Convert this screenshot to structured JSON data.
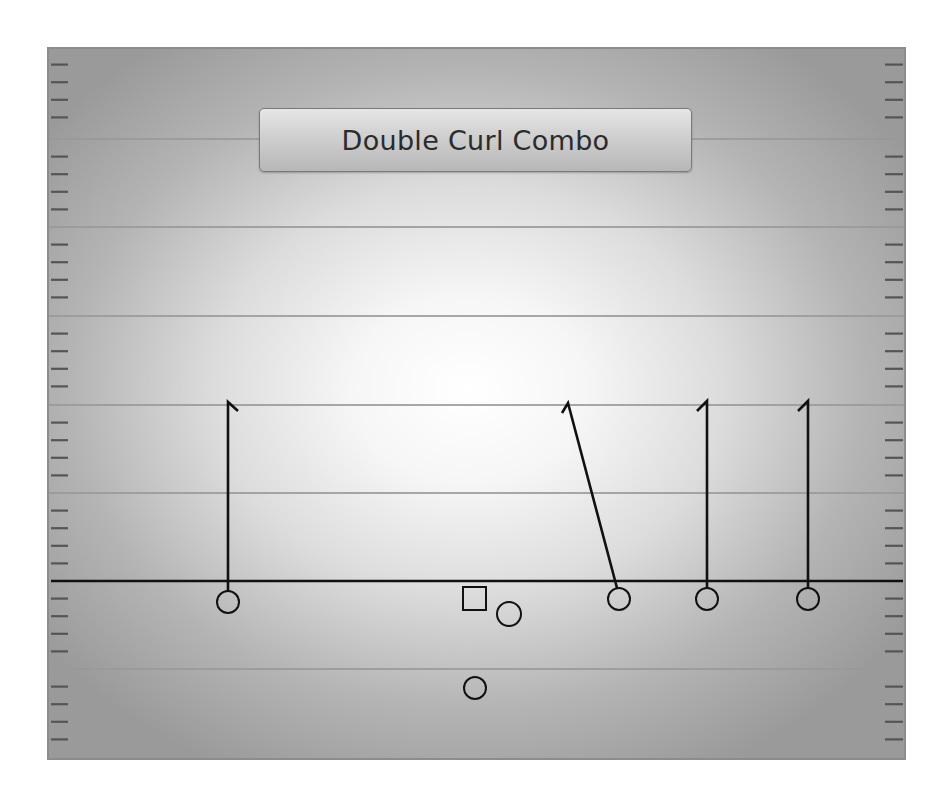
{
  "play": {
    "title": "Double Curl Combo"
  },
  "colors": {
    "field_center": "#ffffff",
    "field_edge": "#9a9a9a",
    "yard_line": "#999999",
    "scrimmage_line": "#111111",
    "route": "#111111",
    "player_stroke": "#111111",
    "hash_mark": "#555555"
  },
  "field": {
    "left": 47,
    "top": 47,
    "right": 906,
    "bottom": 760,
    "yard_lines_y": [
      139,
      227,
      316,
      405,
      493,
      669
    ],
    "scrimmage_line_y": 581,
    "hash_offsets": [
      17.6,
      35.2,
      52.8,
      70.4
    ],
    "left_hash_x": [
      51,
      68
    ],
    "right_hash_x": [
      885,
      903
    ]
  },
  "players": [
    {
      "id": "wr-left",
      "shape": "circle",
      "cx": 228,
      "cy": 602,
      "r": 11
    },
    {
      "id": "center",
      "shape": "square",
      "x": 463,
      "y": 587,
      "size": 23
    },
    {
      "id": "guard",
      "shape": "circle",
      "cx": 509,
      "cy": 614,
      "r": 12
    },
    {
      "id": "te-right",
      "shape": "circle",
      "cx": 619,
      "cy": 599,
      "r": 11
    },
    {
      "id": "slot-right",
      "shape": "circle",
      "cx": 707,
      "cy": 599,
      "r": 11
    },
    {
      "id": "wr-right",
      "shape": "circle",
      "cx": 808,
      "cy": 599,
      "r": 11
    },
    {
      "id": "quarterback",
      "shape": "circle",
      "cx": 475,
      "cy": 688,
      "r": 11
    }
  ],
  "routes": [
    {
      "id": "route-wr-left-curl",
      "points": [
        [
          228,
          591
        ],
        [
          228,
          402
        ],
        [
          238,
          411
        ]
      ]
    },
    {
      "id": "route-te-right-slant-curl",
      "points": [
        [
          617,
          588
        ],
        [
          568,
          403
        ],
        [
          562,
          413
        ]
      ]
    },
    {
      "id": "route-slot-right-curl",
      "points": [
        [
          707,
          588
        ],
        [
          707,
          401
        ],
        [
          697,
          411
        ]
      ]
    },
    {
      "id": "route-wr-right-curl",
      "points": [
        [
          808,
          588
        ],
        [
          808,
          401
        ],
        [
          798,
          411
        ]
      ]
    }
  ]
}
